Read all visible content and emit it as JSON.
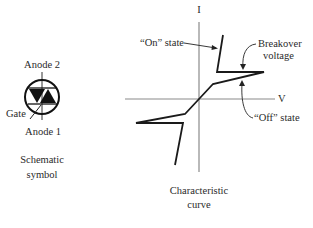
{
  "schematic": {
    "anode2_label": "Anode 2",
    "anode1_label": "Anode 1",
    "gate_label": "Gate",
    "caption_line1": "Schematic",
    "caption_line2": "symbol"
  },
  "characteristic": {
    "y_axis_label": "I",
    "x_axis_label": "V",
    "on_state_label": "“On” state",
    "breakover_line1": "Breakover",
    "breakover_line2": "voltage",
    "off_state_label": "“Off” state",
    "caption_line1": "Characteristic",
    "caption_line2": "curve"
  },
  "colors": {
    "axis": "#8a8a8a",
    "curve": "#1a1a1a",
    "text": "#2a2a2a"
  }
}
